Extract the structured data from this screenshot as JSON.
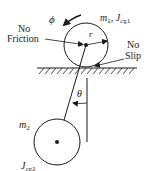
{
  "diagram": {
    "colors": {
      "stroke": "#1a1a1a",
      "background": "#ffffff"
    },
    "labels": {
      "phi": "ϕ",
      "m1": "m",
      "m1_sub": "1",
      "comma": ", ",
      "J1": "J",
      "J1_sub": "cg1",
      "r": "r",
      "no_friction_line1": "No",
      "no_friction_line2": "Friction",
      "no_slip_line1": "No",
      "no_slip_line2": "Slip",
      "theta": "θ",
      "m2": "m",
      "m2_sub": "2",
      "J2": "J",
      "J2_sub": "cg2"
    },
    "geometry": {
      "disk1": {
        "cx": 86,
        "cy": 45,
        "r": 22
      },
      "disk2": {
        "cx": 57,
        "cy": 142,
        "r": 23
      },
      "ground": {
        "x1": 37,
        "x2": 137,
        "y": 68
      },
      "vertical_ref": {
        "x": 87,
        "y1": 78,
        "y2": 142
      },
      "rod": {
        "x1": 86,
        "y1": 45,
        "x2": 64,
        "y2": 120
      }
    }
  }
}
